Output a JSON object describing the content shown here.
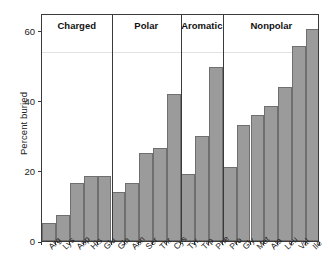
{
  "chart_data": {
    "type": "bar",
    "title": "",
    "subtitle": "",
    "xlabel": "",
    "ylabel": "Percent buried",
    "ylim": [
      0,
      65
    ],
    "yticks": [
      0,
      20,
      40,
      60
    ],
    "grid": false,
    "legend": null,
    "categories": [
      "Arg",
      "Lys",
      "Asp",
      "His",
      "Glu",
      "Gln",
      "Asn",
      "Ser",
      "Thr",
      "Cys",
      "Tyr",
      "Trp",
      "Phe",
      "Pro",
      "Gly",
      "Met",
      "Ala",
      "Leu",
      "Val",
      "Ile"
    ],
    "values": [
      5,
      7.5,
      16.5,
      18.5,
      18.5,
      14,
      16.5,
      25,
      26.5,
      42,
      19,
      30,
      49.5,
      21,
      33,
      36,
      38.5,
      44,
      55.5,
      60.5
    ],
    "bar_color": "#9b9b9b",
    "bar_border_color": "#6f6f6f",
    "axis_color": "#3a3a3a",
    "groups": [
      {
        "label": "Charged",
        "start": 0,
        "end": 5
      },
      {
        "label": "Polar",
        "start": 5,
        "end": 10
      },
      {
        "label": "Aromatic",
        "start": 10,
        "end": 13
      },
      {
        "label": "Nonpolar",
        "start": 13,
        "end": 20
      }
    ]
  }
}
